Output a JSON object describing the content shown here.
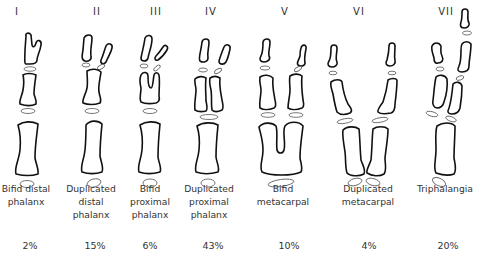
{
  "figure": {
    "types": [
      {
        "numeral": "I",
        "label_lines": [
          "Bifid distal",
          "phalanx"
        ],
        "incidence": "2%"
      },
      {
        "numeral": "II",
        "label_lines": [
          "Duplicated",
          "distal",
          "phalanx"
        ],
        "incidence": "15%"
      },
      {
        "numeral": "III",
        "label_lines": [
          "Bifid",
          "proximal",
          "phalanx"
        ],
        "incidence": "6%"
      },
      {
        "numeral": "IV",
        "label_lines": [
          "Duplicated",
          "proximal",
          "phalanx"
        ],
        "incidence": "43%"
      },
      {
        "numeral": "V",
        "label_lines": [
          "Bifid",
          "metacarpal"
        ],
        "incidence": "10%"
      },
      {
        "numeral": "VI",
        "label_lines": [
          "Duplicated",
          "metacarpal"
        ],
        "incidence": "4%"
      },
      {
        "numeral": "VII",
        "label_lines": [
          "Triphalangia"
        ],
        "incidence": "20%"
      }
    ]
  },
  "colors": {
    "outline": "#111111",
    "growth_plate": "#666666",
    "text": "#333333"
  }
}
